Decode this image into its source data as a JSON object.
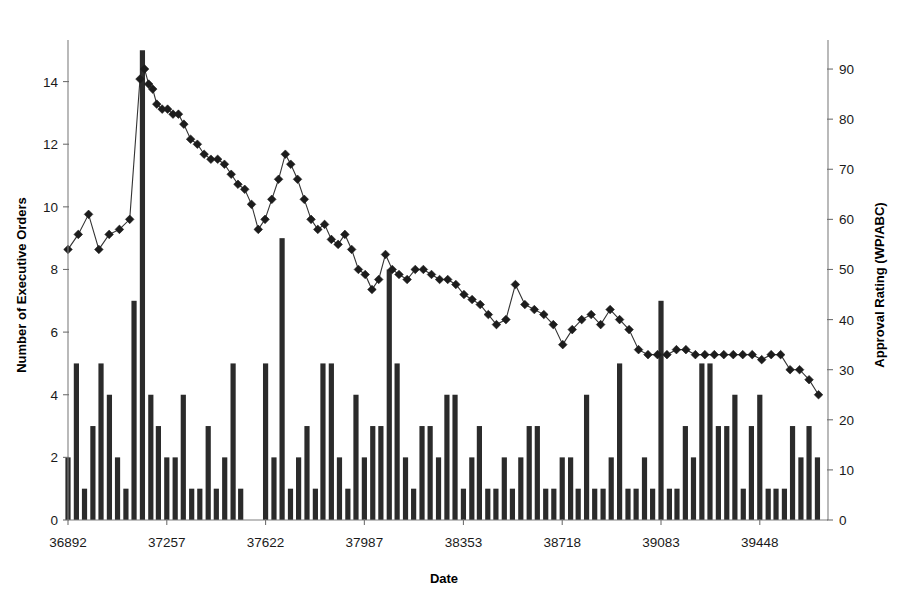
{
  "chart_data": {
    "type": "bar",
    "title": "",
    "subtitle": "",
    "xlabel": "Date",
    "ylabel": "Number of Executive Orders",
    "y2label": "Approval Rating (WP/ABC)",
    "grid": false,
    "legend": "none",
    "xlim": [
      36892,
      39700
    ],
    "ylim": [
      0,
      15.2
    ],
    "y2lim": [
      0,
      95
    ],
    "xticks": [
      36892,
      37257,
      37622,
      37987,
      38353,
      38718,
      39083,
      39448
    ],
    "xticklabels": [
      "36892",
      "37257",
      "37622",
      "37987",
      "38353",
      "38718",
      "39083",
      "39448"
    ],
    "yticks": [
      0,
      2,
      4,
      6,
      8,
      10,
      12,
      14
    ],
    "yticklabels": [
      "0",
      "2",
      "4",
      "6",
      "8",
      "10",
      "12",
      "14"
    ],
    "y2ticks": [
      0,
      10,
      20,
      30,
      40,
      50,
      60,
      70,
      80,
      90
    ],
    "y2ticklabels": [
      "0",
      "10",
      "20",
      "30",
      "40",
      "50",
      "60",
      "70",
      "80",
      "90"
    ],
    "series": [
      {
        "name": "Number of Executive Orders",
        "type": "bar",
        "axis": "left",
        "color": "#2b2b2b",
        "x": [
          36892,
          36923,
          36953,
          36984,
          37014,
          37045,
          37075,
          37106,
          37136,
          37167,
          37198,
          37226,
          37257,
          37288,
          37318,
          37349,
          37379,
          37410,
          37440,
          37471,
          37502,
          37530,
          37622,
          37653,
          37683,
          37714,
          37744,
          37775,
          37806,
          37834,
          37865,
          37895,
          37926,
          37956,
          37987,
          38018,
          38048,
          38079,
          38108,
          38139,
          38169,
          38200,
          38230,
          38261,
          38292,
          38322,
          38353,
          38384,
          38412,
          38443,
          38473,
          38504,
          38534,
          38565,
          38596,
          38626,
          38657,
          38687,
          38718,
          38749,
          38777,
          38808,
          38838,
          38869,
          38899,
          38930,
          38961,
          38991,
          39022,
          39052,
          39083,
          39114,
          39142,
          39173,
          39203,
          39234,
          39264,
          39295,
          39326,
          39356,
          39387,
          39417,
          39448,
          39479,
          39508,
          39539,
          39569,
          39600,
          39630,
          39661
        ],
        "values": [
          2,
          5,
          1,
          3,
          5,
          4,
          2,
          1,
          7,
          15,
          4,
          3,
          2,
          2,
          4,
          1,
          1,
          3,
          1,
          2,
          5,
          1,
          5,
          2,
          9,
          1,
          2,
          3,
          1,
          5,
          5,
          2,
          1,
          4,
          2,
          3,
          3,
          8,
          5,
          2,
          1,
          3,
          3,
          2,
          4,
          4,
          1,
          2,
          3,
          1,
          1,
          2,
          1,
          2,
          3,
          3,
          1,
          1,
          2,
          2,
          1,
          4,
          1,
          1,
          2,
          5,
          1,
          1,
          2,
          1,
          7,
          1,
          1,
          3,
          2,
          5,
          5,
          3,
          3,
          4,
          1,
          3,
          4,
          1,
          1,
          1,
          3,
          2,
          3,
          2
        ]
      },
      {
        "name": "Approval Rating (WP/ABC)",
        "type": "line",
        "axis": "right",
        "color": "#1c1c1c",
        "marker": "diamond",
        "x": [
          36892,
          36930,
          36968,
          37006,
          37044,
          37082,
          37120,
          37158,
          37175,
          37190,
          37205,
          37220,
          37240,
          37260,
          37280,
          37300,
          37320,
          37345,
          37370,
          37395,
          37420,
          37445,
          37470,
          37495,
          37520,
          37545,
          37570,
          37595,
          37620,
          37645,
          37670,
          37695,
          37715,
          37740,
          37765,
          37790,
          37815,
          37840,
          37865,
          37890,
          37915,
          37940,
          37965,
          37990,
          38015,
          38040,
          38065,
          38090,
          38115,
          38145,
          38175,
          38205,
          38235,
          38265,
          38295,
          38325,
          38355,
          38385,
          38415,
          38445,
          38475,
          38510,
          38545,
          38580,
          38615,
          38650,
          38685,
          38720,
          38755,
          38790,
          38825,
          38860,
          38895,
          38930,
          38965,
          39000,
          39035,
          39070,
          39105,
          39140,
          39175,
          39210,
          39245,
          39280,
          39315,
          39350,
          39385,
          39420,
          39455,
          39490,
          39525,
          39560,
          39595,
          39630,
          39665
        ],
        "values": [
          54,
          57,
          61,
          54,
          57,
          58,
          60,
          88,
          90,
          87,
          86,
          83,
          82,
          82,
          81,
          81,
          79,
          76,
          75,
          73,
          72,
          72,
          71,
          69,
          67,
          66,
          63,
          58,
          60,
          64,
          68,
          73,
          71,
          68,
          64,
          60,
          58,
          59,
          56,
          55,
          57,
          54,
          50,
          49,
          46,
          48,
          53,
          50,
          49,
          48,
          50,
          50,
          49,
          48,
          48,
          47,
          45,
          44,
          43,
          41,
          39,
          40,
          47,
          43,
          42,
          41,
          39,
          35,
          38,
          40,
          41,
          39,
          42,
          40,
          38,
          34,
          33,
          33,
          33,
          34,
          34,
          33,
          33,
          33,
          33,
          33,
          33,
          33,
          32,
          33,
          33,
          30,
          30,
          28,
          25
        ]
      }
    ]
  },
  "axis_titles": {
    "x": "Date",
    "y_left": "Number of Executive Orders",
    "y_right": "Approval Rating (WP/ABC)"
  }
}
